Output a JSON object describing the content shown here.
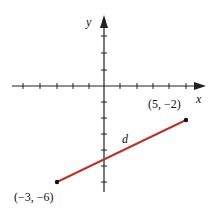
{
  "diagram": {
    "x_axis_label": "x",
    "y_axis_label": "y",
    "segment_label": "d",
    "segment_color": "#b5352a",
    "points": [
      {
        "label": "(5, −2)",
        "x": 5,
        "y": -2
      },
      {
        "label": "(−3, −6)",
        "x": -3,
        "y": -6
      }
    ],
    "x_ticks": [
      -5,
      -4,
      -3,
      -2,
      -1,
      1,
      2,
      3,
      4,
      5
    ],
    "y_ticks": [
      -6,
      -5,
      -4,
      -3,
      -2,
      -1,
      1,
      2,
      3
    ]
  }
}
